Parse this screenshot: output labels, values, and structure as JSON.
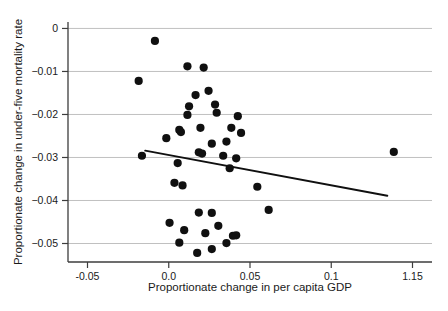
{
  "chart_data": {
    "type": "scatter",
    "title": "",
    "xlabel": "Proportionate change in per capita GDP",
    "ylabel": "Proportionate change in under-five mortality rate",
    "xlim": [
      -0.062,
      0.162
    ],
    "ylim": [
      -0.0543,
      0.0015
    ],
    "grid": true,
    "legend": null,
    "xticks": [
      -0.05,
      0.0,
      0.05,
      0.1,
      0.15
    ],
    "xticklabels": [
      "-0.05",
      "0.0",
      "0.05",
      "0.1",
      "1.15"
    ],
    "yticks": [
      0,
      -0.01,
      -0.02,
      -0.03,
      -0.04,
      -0.05
    ],
    "yticklabels": [
      "0",
      "−0.01",
      "−0.02",
      "−0.03",
      "−0.04",
      "−0.05"
    ],
    "marker": "filled-circle",
    "marker_color": "#101010",
    "marker_size": 4.1,
    "points": [
      {
        "x": -0.0085,
        "y": -0.0029
      },
      {
        "x": -0.0185,
        "y": -0.0122
      },
      {
        "x": 0.0115,
        "y": -0.0088
      },
      {
        "x": 0.0215,
        "y": -0.0091
      },
      {
        "x": 0.0165,
        "y": -0.0155
      },
      {
        "x": 0.0245,
        "y": -0.0145
      },
      {
        "x": 0.0125,
        "y": -0.0181
      },
      {
        "x": 0.0285,
        "y": -0.0177
      },
      {
        "x": 0.0115,
        "y": -0.0201
      },
      {
        "x": 0.0295,
        "y": -0.0196
      },
      {
        "x": 0.0425,
        "y": -0.0204
      },
      {
        "x": 0.0065,
        "y": -0.0236
      },
      {
        "x": 0.0075,
        "y": -0.0241
      },
      {
        "x": 0.0195,
        "y": -0.0231
      },
      {
        "x": 0.0385,
        "y": -0.0231
      },
      {
        "x": 0.0445,
        "y": -0.0243
      },
      {
        "x": -0.0015,
        "y": -0.0255
      },
      {
        "x": 0.0265,
        "y": -0.0268
      },
      {
        "x": 0.0355,
        "y": -0.0263
      },
      {
        "x": -0.0165,
        "y": -0.0296
      },
      {
        "x": 0.0185,
        "y": -0.0288
      },
      {
        "x": 0.0205,
        "y": -0.0291
      },
      {
        "x": 0.0335,
        "y": -0.0296
      },
      {
        "x": 0.0415,
        "y": -0.0302
      },
      {
        "x": 0.1385,
        "y": -0.0287
      },
      {
        "x": 0.0055,
        "y": -0.0313
      },
      {
        "x": 0.0375,
        "y": -0.0325
      },
      {
        "x": 0.0035,
        "y": -0.0359
      },
      {
        "x": 0.0085,
        "y": -0.0365
      },
      {
        "x": 0.0545,
        "y": -0.0368
      },
      {
        "x": 0.0185,
        "y": -0.0428
      },
      {
        "x": 0.0265,
        "y": -0.0429
      },
      {
        "x": 0.0615,
        "y": -0.0422
      },
      {
        "x": 0.0005,
        "y": -0.0452
      },
      {
        "x": 0.0095,
        "y": -0.0469
      },
      {
        "x": 0.0305,
        "y": -0.0459
      },
      {
        "x": 0.0225,
        "y": -0.0476
      },
      {
        "x": 0.0395,
        "y": -0.0482
      },
      {
        "x": 0.0415,
        "y": -0.0481
      },
      {
        "x": 0.0065,
        "y": -0.0498
      },
      {
        "x": 0.0355,
        "y": -0.0499
      },
      {
        "x": 0.0265,
        "y": -0.0513
      },
      {
        "x": 0.0175,
        "y": -0.0522
      }
    ],
    "fit_line": {
      "name": "linear-fit",
      "x0": -0.0145,
      "y0": -0.0284,
      "x1": 0.1345,
      "y1": -0.0389,
      "color": "#101010"
    }
  }
}
